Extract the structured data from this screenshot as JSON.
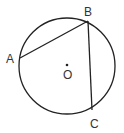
{
  "diagram": {
    "type": "circle-geometry",
    "points": {
      "A": {
        "label": "A",
        "x": 20,
        "y": 58
      },
      "B": {
        "label": "B",
        "x": 88,
        "y": 21
      },
      "C": {
        "label": "C",
        "x": 92,
        "y": 110
      },
      "O": {
        "label": "O",
        "x": 67,
        "y": 65
      }
    },
    "circle": {
      "cx": 67,
      "cy": 66,
      "r": 48
    },
    "segments": [
      [
        "A",
        "B"
      ],
      [
        "B",
        "C"
      ]
    ],
    "stroke_color": "#222222"
  }
}
